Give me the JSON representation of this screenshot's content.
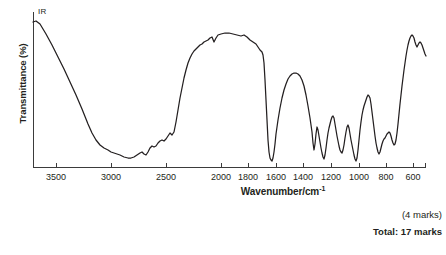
{
  "question": {
    "partial_marks_label": "(4 marks)",
    "total_marks_label": "Total: 17 marks"
  },
  "chart_data": {
    "type": "line",
    "title": "",
    "subtitle": "",
    "series_label": "IR",
    "xlabel": "Wavenumber/cm",
    "xlabel_superscript": "-1",
    "ylabel": "Transmittance (%)",
    "grid": false,
    "legend_position": "inside-top-left",
    "x_axis": {
      "label": "Wavenumber/cm-1",
      "direction": "reversed",
      "unit": "cm^-1",
      "tick_labels": [
        "3500",
        "3000",
        "2500",
        "2000",
        "1800",
        "1600",
        "1400",
        "1200",
        "1000",
        "800",
        "600"
      ],
      "tick_values": [
        3500,
        3000,
        2500,
        2000,
        1800,
        1600,
        1400,
        1200,
        1000,
        800,
        600
      ],
      "range_note": "non-linear: 4000-2000 compressed differently from 2000-600",
      "xlim": [
        4000,
        600
      ]
    },
    "y_axis": {
      "label": "Transmittance (%)",
      "tick_labels": [],
      "ylim": [
        0,
        100
      ],
      "ticks_shown": false
    },
    "annotations": [
      {
        "text": "IR",
        "x_px": 38,
        "y_px": 7
      }
    ],
    "series": [
      {
        "name": "IR",
        "description": "Infrared transmittance spectrum of a carboxylic acid: broad O-H stretch 3300-2500, C-H 2950, strong C=O 1700, fingerprint bands 1500-600",
        "points_px": [
          [
            33,
            22
          ],
          [
            36,
            21
          ],
          [
            40,
            24
          ],
          [
            46,
            34
          ],
          [
            52,
            45
          ],
          [
            58,
            57
          ],
          [
            64,
            69
          ],
          [
            70,
            82
          ],
          [
            76,
            95
          ],
          [
            82,
            109
          ],
          [
            88,
            124
          ],
          [
            92,
            133
          ],
          [
            96,
            140
          ],
          [
            100,
            145
          ],
          [
            104,
            148
          ],
          [
            108,
            150
          ],
          [
            111,
            152
          ],
          [
            114,
            153
          ],
          [
            117,
            154
          ],
          [
            120,
            155
          ],
          [
            124,
            157
          ],
          [
            128,
            158
          ],
          [
            131,
            158
          ],
          [
            134,
            157
          ],
          [
            137,
            155
          ],
          [
            140,
            153
          ],
          [
            142,
            152
          ],
          [
            144,
            154
          ],
          [
            146,
            155
          ],
          [
            148,
            152
          ],
          [
            150,
            148
          ],
          [
            152,
            146
          ],
          [
            154,
            147
          ],
          [
            156,
            146
          ],
          [
            158,
            143
          ],
          [
            160,
            141
          ],
          [
            162,
            140
          ],
          [
            164,
            141
          ],
          [
            166,
            139
          ],
          [
            168,
            136
          ],
          [
            170,
            133
          ],
          [
            172,
            135
          ],
          [
            174,
            132
          ],
          [
            176,
            122
          ],
          [
            178,
            110
          ],
          [
            180,
            98
          ],
          [
            182,
            88
          ],
          [
            184,
            78
          ],
          [
            186,
            70
          ],
          [
            188,
            63
          ],
          [
            190,
            58
          ],
          [
            192,
            54
          ],
          [
            194,
            51
          ],
          [
            196,
            49
          ],
          [
            198,
            47
          ],
          [
            200,
            45
          ],
          [
            202,
            44
          ],
          [
            204,
            42
          ],
          [
            206,
            41
          ],
          [
            208,
            40
          ],
          [
            210,
            38
          ],
          [
            212,
            37
          ],
          [
            214,
            42
          ],
          [
            216,
            38
          ],
          [
            218,
            35
          ],
          [
            221,
            34
          ],
          [
            225,
            33
          ],
          [
            229,
            33
          ],
          [
            233,
            34
          ],
          [
            237,
            35
          ],
          [
            241,
            36
          ],
          [
            244,
            35
          ],
          [
            247,
            37
          ],
          [
            250,
            40
          ],
          [
            253,
            42
          ],
          [
            256,
            44
          ],
          [
            258,
            47
          ],
          [
            260,
            50
          ],
          [
            262,
            52
          ],
          [
            263,
            55
          ],
          [
            264,
            63
          ],
          [
            265,
            80
          ],
          [
            266,
            100
          ],
          [
            267,
            120
          ],
          [
            268,
            140
          ],
          [
            269,
            152
          ],
          [
            270,
            158
          ],
          [
            271,
            160
          ],
          [
            272,
            161
          ],
          [
            273,
            158
          ],
          [
            274,
            152
          ],
          [
            275,
            144
          ],
          [
            276,
            134
          ],
          [
            278,
            120
          ],
          [
            280,
            108
          ],
          [
            282,
            98
          ],
          [
            284,
            90
          ],
          [
            286,
            84
          ],
          [
            288,
            79
          ],
          [
            290,
            76
          ],
          [
            292,
            74
          ],
          [
            294,
            73
          ],
          [
            296,
            73
          ],
          [
            298,
            74
          ],
          [
            300,
            76
          ],
          [
            302,
            80
          ],
          [
            304,
            86
          ],
          [
            306,
            95
          ],
          [
            308,
            106
          ],
          [
            310,
            118
          ],
          [
            312,
            132
          ],
          [
            313,
            143
          ],
          [
            314,
            150
          ],
          [
            315,
            144
          ],
          [
            316,
            134
          ],
          [
            317,
            127
          ],
          [
            318,
            130
          ],
          [
            319,
            136
          ],
          [
            320,
            142
          ],
          [
            321,
            148
          ],
          [
            322,
            153
          ],
          [
            323,
            157
          ],
          [
            324,
            159
          ],
          [
            325,
            155
          ],
          [
            326,
            148
          ],
          [
            327,
            140
          ],
          [
            328,
            133
          ],
          [
            329,
            128
          ],
          [
            330,
            124
          ],
          [
            331,
            120
          ],
          [
            332,
            117
          ],
          [
            333,
            116
          ],
          [
            334,
            118
          ],
          [
            335,
            124
          ],
          [
            336,
            130
          ],
          [
            337,
            136
          ],
          [
            338,
            141
          ],
          [
            339,
            146
          ],
          [
            340,
            150
          ],
          [
            341,
            152
          ],
          [
            342,
            153
          ],
          [
            343,
            150
          ],
          [
            344,
            145
          ],
          [
            345,
            138
          ],
          [
            346,
            132
          ],
          [
            347,
            127
          ],
          [
            348,
            125
          ],
          [
            349,
            128
          ],
          [
            350,
            134
          ],
          [
            351,
            140
          ],
          [
            352,
            145
          ],
          [
            353,
            150
          ],
          [
            354,
            155
          ],
          [
            355,
            159
          ],
          [
            356,
            161
          ],
          [
            357,
            158
          ],
          [
            358,
            150
          ],
          [
            359,
            140
          ],
          [
            360,
            130
          ],
          [
            361,
            122
          ],
          [
            362,
            115
          ],
          [
            363,
            110
          ],
          [
            364,
            106
          ],
          [
            365,
            103
          ],
          [
            366,
            100
          ],
          [
            367,
            97
          ],
          [
            368,
            95
          ],
          [
            369,
            96
          ],
          [
            370,
            98
          ],
          [
            371,
            104
          ],
          [
            372,
            112
          ],
          [
            373,
            120
          ],
          [
            374,
            128
          ],
          [
            375,
            136
          ],
          [
            376,
            143
          ],
          [
            377,
            148
          ],
          [
            378,
            152
          ],
          [
            379,
            154
          ],
          [
            380,
            152
          ],
          [
            381,
            148
          ],
          [
            382,
            144
          ],
          [
            383,
            141
          ],
          [
            384,
            139
          ],
          [
            385,
            138
          ],
          [
            386,
            136
          ],
          [
            387,
            134
          ],
          [
            388,
            133
          ],
          [
            389,
            132
          ],
          [
            390,
            133
          ],
          [
            391,
            136
          ],
          [
            392,
            140
          ],
          [
            393,
            143
          ],
          [
            394,
            145
          ],
          [
            395,
            144
          ],
          [
            396,
            140
          ],
          [
            397,
            133
          ],
          [
            398,
            124
          ],
          [
            399,
            114
          ],
          [
            400,
            104
          ],
          [
            401,
            95
          ],
          [
            402,
            86
          ],
          [
            403,
            78
          ],
          [
            404,
            70
          ],
          [
            405,
            63
          ],
          [
            406,
            56
          ],
          [
            407,
            50
          ],
          [
            408,
            45
          ],
          [
            409,
            41
          ],
          [
            410,
            38
          ],
          [
            411,
            36
          ],
          [
            412,
            35
          ],
          [
            413,
            36
          ],
          [
            414,
            38
          ],
          [
            415,
            42
          ],
          [
            416,
            45
          ],
          [
            417,
            47
          ],
          [
            418,
            45
          ],
          [
            419,
            43
          ],
          [
            420,
            42
          ],
          [
            421,
            43
          ],
          [
            422,
            45
          ],
          [
            423,
            48
          ],
          [
            424,
            51
          ],
          [
            425,
            54
          ],
          [
            426,
            56
          ]
        ]
      }
    ],
    "key_absorption_bands": [
      {
        "assignment": "O-H stretch (broad, carboxylic acid)",
        "wavenumber": 3000,
        "note": "deep broad trough 3400-2500"
      },
      {
        "assignment": "C-H stretch",
        "wavenumber": 2900,
        "note": "shoulder on broad O-H"
      },
      {
        "assignment": "C=O stretch (strong, sharp)",
        "wavenumber": 1715,
        "note": "deepest sharp trough"
      },
      {
        "assignment": "C-O / fingerprint bands",
        "wavenumber": 1250,
        "note": "multiple sharp troughs 1500-1000"
      }
    ]
  },
  "axis_geometry": {
    "plot_left_px": 33,
    "plot_right_px": 426,
    "plot_bottom_px": 167,
    "plot_top_px": 12,
    "tick_x_px": [
      56,
      111,
      166,
      221,
      248,
      276,
      303,
      331,
      359,
      386,
      413
    ]
  },
  "colors": {
    "ink": "#231f20",
    "axis": "#3b3b3b",
    "background": "#ffffff"
  }
}
